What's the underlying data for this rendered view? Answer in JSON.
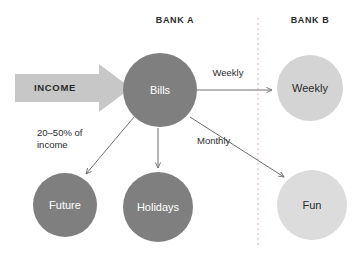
{
  "diagram": {
    "background_color": "#ffffff",
    "headers": [
      {
        "id": "bank-a",
        "label": "BANK A",
        "x": 175,
        "y": 23
      },
      {
        "id": "bank-b",
        "label": "BANK B",
        "x": 310,
        "y": 23
      }
    ],
    "divider": {
      "name": "bank-divider",
      "orientation": "vertical",
      "x": 258,
      "y_start": 18,
      "y_end": 246,
      "style": "dashed",
      "color": "#d9b7b7"
    },
    "income_arrow": {
      "label": "INCOME",
      "fill": "#c7c7c7",
      "text_color": "#2b2b2b",
      "label_x": 55,
      "label_y": 90,
      "points": "15,74 99,74 99,64 131,88 99,112 99,102 15,102"
    },
    "nodes": [
      {
        "id": "bills",
        "label": "Bills",
        "cx": 160,
        "cy": 90,
        "r": 37,
        "fill": "#7f7f7f",
        "text_color": "#ffffff",
        "bank": "BANK A"
      },
      {
        "id": "future",
        "label": "Future",
        "cx": 65,
        "cy": 205,
        "r": 32,
        "fill": "#7f7f7f",
        "text_color": "#ffffff",
        "bank": "BANK A"
      },
      {
        "id": "holidays",
        "label": "Holidays",
        "cx": 158,
        "cy": 207,
        "r": 35,
        "fill": "#7f7f7f",
        "text_color": "#ffffff",
        "bank": "BANK A"
      },
      {
        "id": "weekly",
        "label": "Weekly",
        "cx": 310,
        "cy": 88,
        "r": 33,
        "fill": "#d4d4d4",
        "text_color": "#2b2b2b",
        "bank": "BANK B"
      },
      {
        "id": "fun",
        "label": "Fun",
        "cx": 312,
        "cy": 205,
        "r": 35,
        "fill": "#dcdcdc",
        "text_color": "#2b2b2b",
        "bank": "BANK B"
      }
    ],
    "edges": [
      {
        "id": "bills-to-weekly",
        "from": "bills",
        "to": "weekly",
        "label": "Weekly",
        "label_x": 228,
        "label_y": 75,
        "label_anchor": "middle",
        "x1": 196,
        "y1": 90,
        "x2": 274,
        "y2": 90
      },
      {
        "id": "bills-to-future",
        "from": "bills",
        "to": "future",
        "label_line1": "20–50% of",
        "label_line2": "income",
        "label_x": 37,
        "label_y": 136,
        "label_anchor": "start",
        "x1": 134,
        "y1": 117,
        "x2": 84,
        "y2": 176
      },
      {
        "id": "bills-to-holidays",
        "from": "bills",
        "to": "holidays",
        "label": "",
        "x1": 158,
        "y1": 128,
        "x2": 158,
        "y2": 170
      },
      {
        "id": "bills-to-fun",
        "from": "bills",
        "to": "fun",
        "label": "Monthly",
        "label_x": 198,
        "label_y": 143,
        "label_anchor": "start",
        "x1": 190,
        "y1": 117,
        "x2": 285,
        "y2": 178
      }
    ]
  }
}
